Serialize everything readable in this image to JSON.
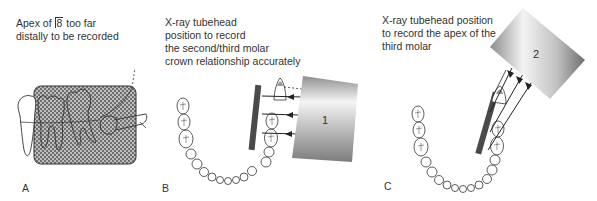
{
  "panels": [
    {
      "id": "A",
      "label": "A",
      "caption_pre": "Apex of ",
      "caption_tooth": "8",
      "caption_post": " too far",
      "caption_line2": "distally to be recorded"
    },
    {
      "id": "B",
      "label": "B",
      "caption_lines": [
        "X-ray tubehead",
        "position to record",
        "the second/third molar",
        "crown relationship accurately"
      ],
      "tubehead_label": "1"
    },
    {
      "id": "C",
      "label": "C",
      "caption_lines": [
        "X-ray tubehead position",
        "to record the apex of the",
        "third molar"
      ],
      "tubehead_label": "2"
    }
  ],
  "colors": {
    "film": "#4a4a4a",
    "outline": "#333333",
    "hatch": "#8a8a8a",
    "tube_dark": "#8c8c8c",
    "tube_light": "#f4f4f4"
  }
}
